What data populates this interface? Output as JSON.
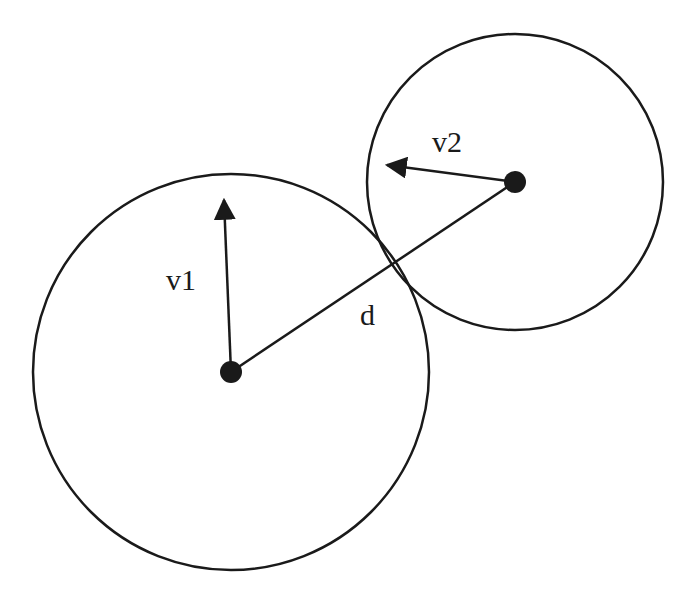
{
  "diagram": {
    "stroke_color": "#1a1a1a",
    "background": "#ffffff",
    "circles": [
      {
        "id": "circle-1",
        "cx": 231,
        "cy": 372,
        "r": 198
      },
      {
        "id": "circle-2",
        "cx": 515,
        "cy": 182,
        "r": 148
      }
    ],
    "vectors": [
      {
        "id": "v1",
        "label": "v1",
        "from": [
          231,
          372
        ],
        "to": [
          224,
          198
        ],
        "label_pos": [
          166,
          290
        ]
      },
      {
        "id": "v2",
        "label": "v2",
        "from": [
          515,
          182
        ],
        "to": [
          385,
          165
        ],
        "label_pos": [
          432,
          152
        ]
      }
    ],
    "distance_line": {
      "label": "d",
      "from": [
        231,
        372
      ],
      "to": [
        515,
        182
      ],
      "label_pos": [
        360,
        323
      ]
    }
  }
}
